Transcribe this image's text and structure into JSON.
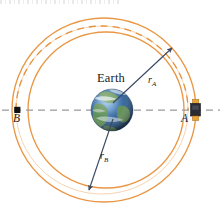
{
  "figure": {
    "title_strip": "",
    "labels": {
      "earth": "Earth",
      "point_a": "A",
      "point_b": "B",
      "radius_a": "r",
      "radius_a_sub": "A",
      "radius_b": "r",
      "radius_b_sub": "B"
    },
    "colors": {
      "orbit_stroke": "#E8913A",
      "orbit_stroke_light": "#F0B070",
      "transfer_dashed": "#E8913A",
      "axis_dashed": "#9A9AA0",
      "arrow": "#3A4A63",
      "marker_black": "#111111",
      "satellite_body": "#2A2A33",
      "satellite_panel": "#E8A33A",
      "earth_ocean": "#2E5E96",
      "earth_land": "#5E8F4E",
      "earth_cloud": "#E8EFF5",
      "background": "#FFFFFF"
    },
    "elements": [
      {
        "name": "inner-circular-orbit",
        "type": "circle",
        "cx": 106,
        "cy": 110,
        "r": 78,
        "style": "solid"
      },
      {
        "name": "transfer-ellipse",
        "type": "ellipse",
        "cx": 102,
        "cy": 110,
        "rx": 86,
        "ry": 84,
        "style": "dashed"
      },
      {
        "name": "outer-circular-orbit",
        "type": "circle",
        "cx": 104,
        "cy": 110,
        "r": 92,
        "style": "solid"
      },
      {
        "name": "horizontal-axis",
        "type": "line",
        "x1": 2,
        "y1": 110,
        "x2": 220,
        "y2": 110,
        "style": "dashed"
      },
      {
        "name": "radius-a-vector",
        "type": "arrow",
        "x1": 112,
        "y1": 104,
        "x2": 172,
        "y2": 48
      },
      {
        "name": "radius-b-vector",
        "type": "arrow",
        "x1": 112,
        "y1": 118,
        "x2": 88,
        "y2": 192
      },
      {
        "name": "point-a-satellite",
        "type": "satellite",
        "x": 195,
        "y": 110
      },
      {
        "name": "point-b-marker",
        "type": "square",
        "x": 17,
        "y": 110
      },
      {
        "name": "earth-globe",
        "type": "sphere",
        "cx": 112,
        "cy": 110,
        "r": 21
      }
    ]
  }
}
